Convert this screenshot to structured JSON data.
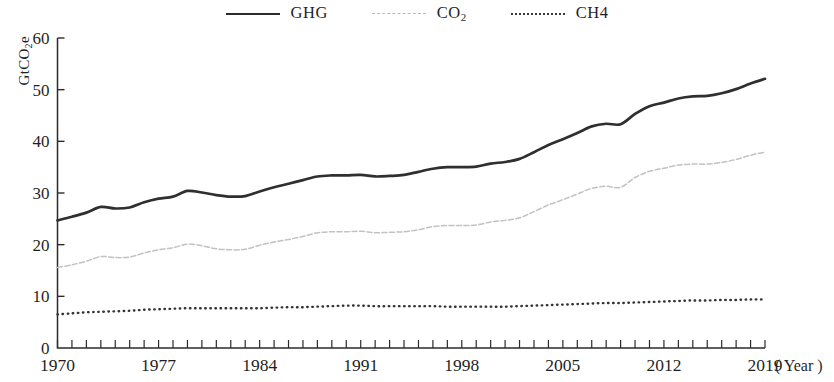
{
  "legend": {
    "items": [
      {
        "key": "ghg",
        "label": "GHG",
        "style": "solid",
        "color": "#2f2f2f"
      },
      {
        "key": "co2",
        "label": "CO",
        "label_sub": "2",
        "style": "dashed",
        "color": "#c2c2c2"
      },
      {
        "key": "ch4",
        "label": "CH4",
        "style": "dotted",
        "color": "#333333"
      }
    ]
  },
  "axes": {
    "y_label_main": "GtCO",
    "y_label_sub": "2",
    "y_label_tail": "e",
    "y_ticks": [
      "0",
      "10",
      "20",
      "30",
      "40",
      "50",
      "60"
    ],
    "x_ticks": [
      "1970",
      "1977",
      "1984",
      "1991",
      "1998",
      "2005",
      "2012",
      "2019"
    ],
    "x_unit": "( Year )"
  },
  "chart_data": {
    "type": "line",
    "title": "",
    "xlabel": "Year",
    "ylabel": "GtCO2e",
    "xlim": [
      1970,
      2019
    ],
    "ylim": [
      0,
      60
    ],
    "ytick_step": 10,
    "xtick_step": 7,
    "xtick_minor_step": 1,
    "grid": false,
    "legend_position": "top-center",
    "x": [
      1970,
      1971,
      1972,
      1973,
      1974,
      1975,
      1976,
      1977,
      1978,
      1979,
      1980,
      1981,
      1982,
      1983,
      1984,
      1985,
      1986,
      1987,
      1988,
      1989,
      1990,
      1991,
      1992,
      1993,
      1994,
      1995,
      1996,
      1997,
      1998,
      1999,
      2000,
      2001,
      2002,
      2003,
      2004,
      2005,
      2006,
      2007,
      2008,
      2009,
      2010,
      2011,
      2012,
      2013,
      2014,
      2015,
      2016,
      2017,
      2018,
      2019
    ],
    "series": [
      {
        "name": "GHG",
        "color": "#2f2f2f",
        "style": "solid",
        "values": [
          24.7,
          25.4,
          26.2,
          27.3,
          27.0,
          27.2,
          28.2,
          28.9,
          29.3,
          30.4,
          30.1,
          29.6,
          29.3,
          29.4,
          30.3,
          31.1,
          31.8,
          32.5,
          33.2,
          33.4,
          33.4,
          33.5,
          33.2,
          33.3,
          33.5,
          34.1,
          34.7,
          35.0,
          35.0,
          35.1,
          35.7,
          36.0,
          36.6,
          37.9,
          39.3,
          40.4,
          41.6,
          42.9,
          43.4,
          43.3,
          45.3,
          46.8,
          47.5,
          48.3,
          48.7,
          48.8,
          49.3,
          50.1,
          51.2,
          52.1
        ]
      },
      {
        "name": "CO2",
        "color": "#c2c2c2",
        "style": "dashed",
        "values": [
          15.6,
          16.1,
          16.8,
          17.7,
          17.5,
          17.6,
          18.4,
          19.0,
          19.4,
          20.1,
          19.8,
          19.2,
          19.0,
          19.1,
          19.9,
          20.5,
          21.0,
          21.6,
          22.3,
          22.5,
          22.5,
          22.6,
          22.3,
          22.4,
          22.5,
          22.9,
          23.5,
          23.7,
          23.7,
          23.8,
          24.4,
          24.7,
          25.2,
          26.4,
          27.7,
          28.7,
          29.8,
          30.9,
          31.3,
          31.1,
          33.0,
          34.2,
          34.8,
          35.4,
          35.6,
          35.6,
          35.9,
          36.5,
          37.3,
          37.9
        ]
      },
      {
        "name": "CH4",
        "color": "#333333",
        "style": "dotted",
        "values": [
          6.5,
          6.7,
          6.9,
          7.0,
          7.1,
          7.2,
          7.4,
          7.5,
          7.6,
          7.7,
          7.7,
          7.7,
          7.7,
          7.7,
          7.7,
          7.8,
          7.9,
          7.9,
          8.0,
          8.1,
          8.2,
          8.2,
          8.1,
          8.1,
          8.1,
          8.1,
          8.1,
          8.0,
          8.0,
          8.0,
          8.0,
          8.0,
          8.1,
          8.2,
          8.3,
          8.4,
          8.5,
          8.6,
          8.7,
          8.7,
          8.8,
          8.9,
          9.0,
          9.1,
          9.2,
          9.2,
          9.3,
          9.3,
          9.4,
          9.4
        ]
      }
    ]
  }
}
